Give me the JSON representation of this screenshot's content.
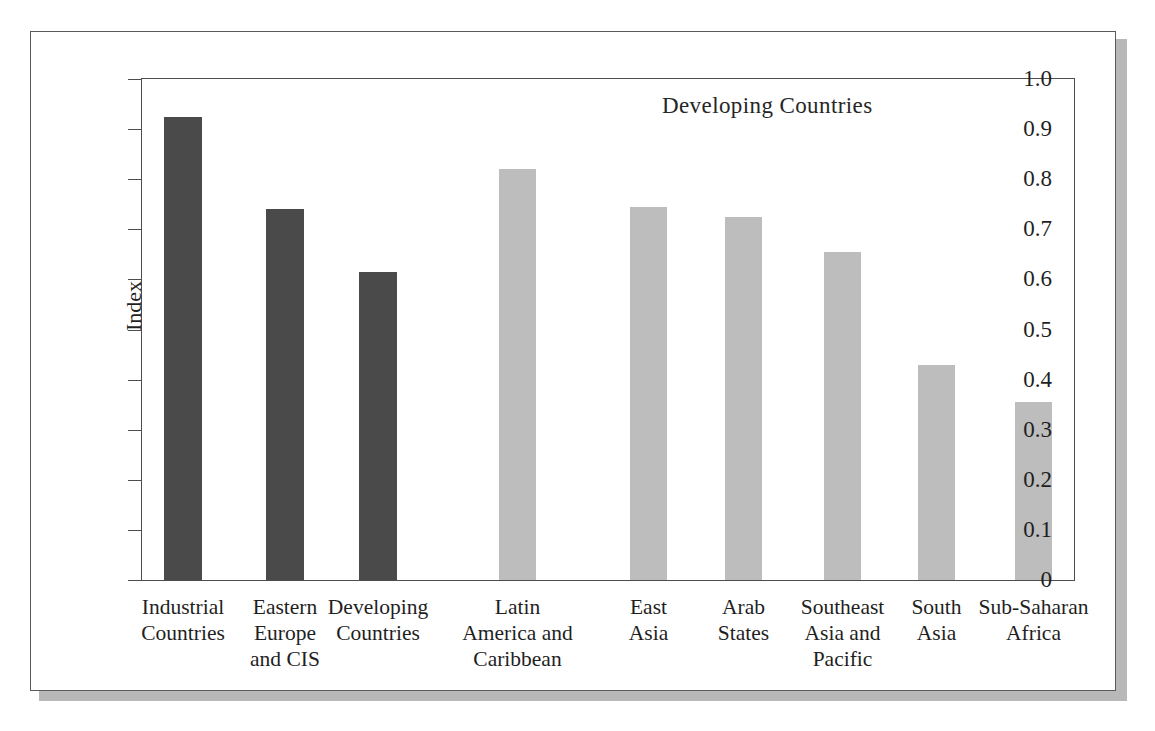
{
  "figure": {
    "annotation": "Developing Countries",
    "y_axis_title": "Index"
  },
  "chart_data": {
    "type": "bar",
    "title": "",
    "annotation": "Developing Countries",
    "xlabel": "",
    "ylabel": "Index",
    "ylim": [
      0,
      1.0
    ],
    "grid": false,
    "legend": "none",
    "ytick_labels": [
      "1.0",
      "0.9",
      "0.8",
      "0.7",
      "0.6",
      "0.5",
      "0.4",
      "0.3",
      "0.2",
      "0.1",
      "0"
    ],
    "ytick_values": [
      1.0,
      0.9,
      0.8,
      0.7,
      0.6,
      0.5,
      0.4,
      0.3,
      0.2,
      0.1,
      0
    ],
    "colors": {
      "aggregate_bars": "#4a4a4a",
      "region_bars": "#bdbdbd"
    },
    "groups": [
      {
        "name": "aggregates",
        "color": "#4a4a4a",
        "categories": [
          "Industrial Countries",
          "Eastern Europe and CIS",
          "Developing Countries"
        ],
        "values": [
          0.925,
          0.74,
          0.615
        ]
      },
      {
        "name": "developing regions",
        "color": "#bdbdbd",
        "categories": [
          "Latin America and Caribbean",
          "East Asia",
          "Arab States",
          "Southeast Asia and Pacific",
          "South Asia",
          "Sub-Saharan Africa"
        ],
        "values": [
          0.82,
          0.745,
          0.725,
          0.655,
          0.43,
          0.355
        ]
      }
    ],
    "categories": [
      "Industrial Countries",
      "Eastern Europe and CIS",
      "Developing Countries",
      "Latin America and Caribbean",
      "East Asia",
      "Arab States",
      "Southeast Asia and Pacific",
      "South Asia",
      "Sub-Saharan Africa"
    ],
    "values": [
      0.925,
      0.74,
      0.615,
      0.82,
      0.745,
      0.725,
      0.655,
      0.43,
      0.355
    ],
    "bars": [
      {
        "label_lines": [
          "Industrial",
          "Countries"
        ],
        "value": 0.925,
        "color": "#4a4a4a",
        "x": 22,
        "width": 38
      },
      {
        "label_lines": [
          "Eastern",
          "Europe",
          "and CIS"
        ],
        "value": 0.74,
        "color": "#4a4a4a",
        "x": 124,
        "width": 38
      },
      {
        "label_lines": [
          "Developing",
          "Countries"
        ],
        "value": 0.615,
        "color": "#4a4a4a",
        "x": 217,
        "width": 38
      },
      {
        "label_lines": [
          "Latin",
          "America and",
          "Caribbean"
        ],
        "value": 0.82,
        "color": "#bdbdbd",
        "x": 357,
        "width": 37
      },
      {
        "label_lines": [
          "East",
          "Asia"
        ],
        "value": 0.745,
        "color": "#bdbdbd",
        "x": 488,
        "width": 37
      },
      {
        "label_lines": [
          "Arab",
          "States"
        ],
        "value": 0.725,
        "color": "#bdbdbd",
        "x": 583,
        "width": 37
      },
      {
        "label_lines": [
          "Southeast",
          "Asia and",
          "Pacific"
        ],
        "value": 0.655,
        "color": "#bdbdbd",
        "x": 682,
        "width": 37
      },
      {
        "label_lines": [
          "South",
          "Asia"
        ],
        "value": 0.43,
        "color": "#bdbdbd",
        "x": 776,
        "width": 37
      },
      {
        "label_lines": [
          "Sub-Saharan",
          "Africa"
        ],
        "value": 0.355,
        "color": "#bdbdbd",
        "x": 873,
        "width": 37
      }
    ]
  }
}
